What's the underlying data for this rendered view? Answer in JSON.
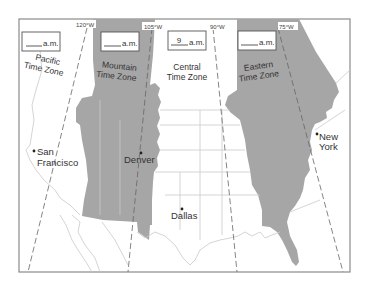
{
  "map": {
    "title": "United States Time Zones",
    "colors": {
      "shaded_zone": "#a6a6a6",
      "background": "#ffffff",
      "frame": "#8a8a8a",
      "border_lines": "#c9c9c9",
      "meridian_lines": "#666666",
      "text": "#333333"
    },
    "meridians": [
      {
        "label": "120°W"
      },
      {
        "label": "105°W"
      },
      {
        "label": "90°W"
      },
      {
        "label": "75°W"
      }
    ],
    "zones": [
      {
        "name_line1": "Pacific",
        "name_line2": "Time Zone",
        "time_value": "",
        "time_suffix": "a.m.",
        "shaded": false
      },
      {
        "name_line1": "Mountain",
        "name_line2": "Time Zone",
        "time_value": "",
        "time_suffix": "a.m.",
        "shaded": true
      },
      {
        "name_line1": "Central",
        "name_line2": "Time Zone",
        "time_value": "9",
        "time_suffix": "a.m.",
        "shaded": false
      },
      {
        "name_line1": "Eastern",
        "name_line2": "Time Zone",
        "time_value": "",
        "time_suffix": "a.m.",
        "shaded": true
      }
    ],
    "cities": [
      {
        "name_line1": "San",
        "name_line2": "Francisco"
      },
      {
        "name_line1": "Denver",
        "name_line2": ""
      },
      {
        "name_line1": "Dallas",
        "name_line2": ""
      },
      {
        "name_line1": "New",
        "name_line2": "York"
      }
    ]
  }
}
